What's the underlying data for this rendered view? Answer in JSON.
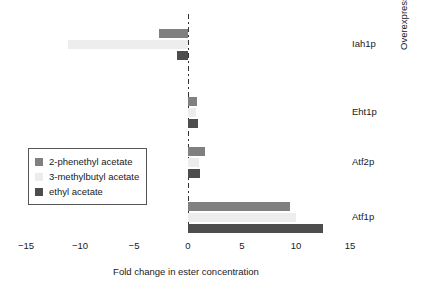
{
  "chart_data": {
    "type": "bar",
    "orientation": "horizontal",
    "title": "",
    "xlabel": "Fold change in ester concentration",
    "ylabel": "Overexpressed enzyme",
    "categories": [
      "Atf1p",
      "Atf2p",
      "Eht1p",
      "Iah1p"
    ],
    "categories_top_to_bottom": [
      "Iah1p",
      "Eht1p",
      "Atf2p",
      "Atf1p"
    ],
    "series": [
      {
        "name": "2-phenethyl acetate",
        "color": "#808080",
        "values": [
          9.4,
          1.6,
          0.8,
          -2.7
        ]
      },
      {
        "name": "3-methylbutyl acetate",
        "color": "#ededed",
        "values": [
          10.0,
          1.0,
          0.7,
          -11.1
        ]
      },
      {
        "name": "ethyl acetate",
        "color": "#4d4d4d",
        "values": [
          12.5,
          1.1,
          0.9,
          -1.0
        ]
      }
    ],
    "xticks": [
      "-15",
      "-10",
      "-5",
      "0",
      "5",
      "10",
      "15"
    ],
    "xtick_values": [
      -15,
      -10,
      -5,
      0,
      5,
      10,
      15
    ],
    "xlim": [
      -15.5,
      17.0
    ],
    "grid": false,
    "zero_line": "dash-dot",
    "legend_position": "center-left"
  },
  "axes": {
    "x_title": "Fold change in ester concentration",
    "y_title": "Overexpressed enzyme",
    "x_ticks": [
      {
        "label": "-15"
      },
      {
        "label": "-10"
      },
      {
        "label": "-5"
      },
      {
        "label": "0"
      },
      {
        "label": "5"
      },
      {
        "label": "10"
      },
      {
        "label": "15"
      }
    ],
    "y_ticks": [
      {
        "label": "Iah1p"
      },
      {
        "label": "Eht1p"
      },
      {
        "label": "Atf2p"
      },
      {
        "label": "Atf1p"
      }
    ]
  },
  "legend": {
    "items": [
      {
        "label": "2-phenethyl acetate",
        "color": "#808080"
      },
      {
        "label": "3-methylbutyl acetate",
        "color": "#ededed"
      },
      {
        "label": "ethyl acetate",
        "color": "#4d4d4d"
      }
    ]
  },
  "colors": {
    "phenethyl": "#808080",
    "methylbutyl": "#ededed",
    "ethyl": "#4d4d4d",
    "axis_text": "#1a1a1a",
    "zero_line": "#333333",
    "background": "#ffffff"
  }
}
